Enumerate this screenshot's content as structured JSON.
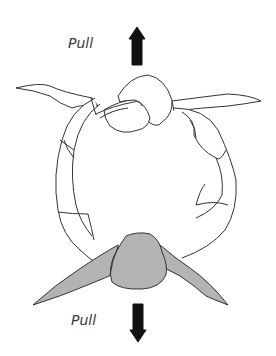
{
  "diagram": {
    "labels": {
      "top": "Pull",
      "bottom": "Pull"
    },
    "arrows": {
      "top": "arrow-up",
      "bottom": "arrow-down"
    },
    "colors": {
      "stroke": "#333333",
      "fill_white": "#ffffff",
      "fill_gray": "#b3b3b3",
      "arrow": "#111111"
    }
  }
}
